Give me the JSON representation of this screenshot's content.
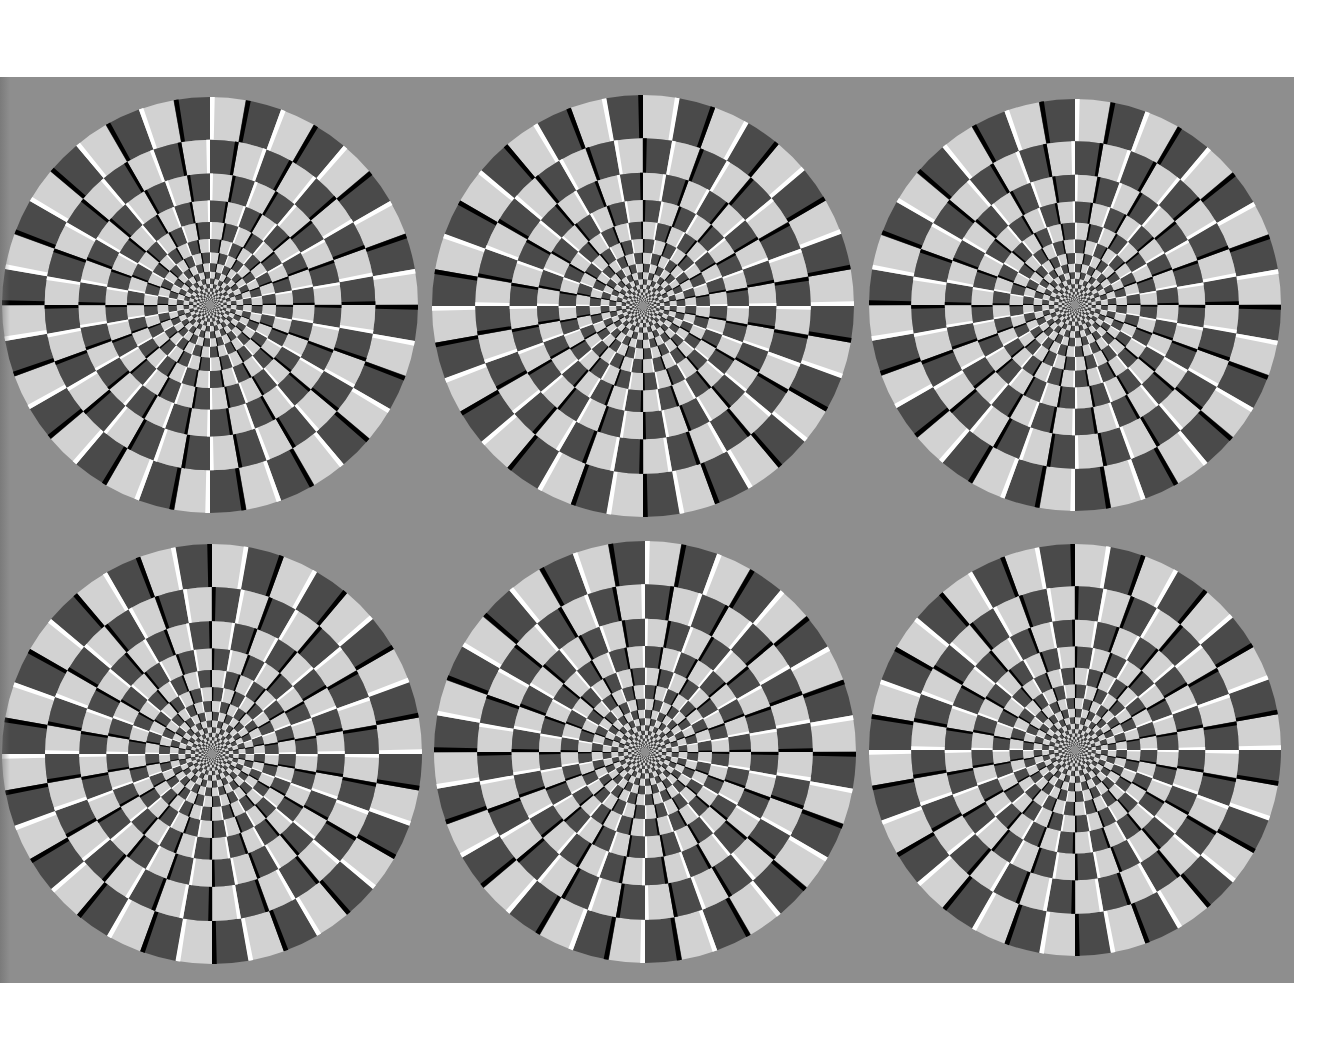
{
  "figure": {
    "type": "peripheral-drift-illusion",
    "layout": {
      "rows": 2,
      "columns": 3
    },
    "panel": {
      "x": 0,
      "y": 77,
      "width": 1294,
      "height": 906
    },
    "colors": {
      "page_background": "#ffffff",
      "panel_background": "#8e8e8e",
      "light_sector": "#d2d2d2",
      "dark_sector": "#4a4a4a",
      "light_stripe": "#ffffff",
      "dark_stripe": "#000000"
    },
    "pattern": {
      "sectors_per_ring": 36,
      "ring_count": 17,
      "ring_ratio": 0.795,
      "stripe_fraction": 0.13
    },
    "discs": [
      {
        "id": "disc-top-left",
        "cx": 210,
        "cy": 305,
        "r": 208,
        "direction": 1
      },
      {
        "id": "disc-top-center",
        "cx": 643,
        "cy": 306,
        "r": 211,
        "direction": -1
      },
      {
        "id": "disc-top-right",
        "cx": 1075,
        "cy": 305,
        "r": 206,
        "direction": 1
      },
      {
        "id": "disc-bottom-left",
        "cx": 212,
        "cy": 754,
        "r": 210,
        "direction": -1
      },
      {
        "id": "disc-bottom-center",
        "cx": 645,
        "cy": 752,
        "r": 211,
        "direction": 1
      },
      {
        "id": "disc-bottom-right",
        "cx": 1075,
        "cy": 750,
        "r": 206,
        "direction": -1
      }
    ]
  }
}
